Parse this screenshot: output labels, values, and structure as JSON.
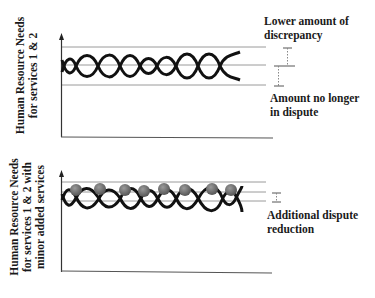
{
  "panels": [
    {
      "id": "top",
      "y_axis_label_lines": [
        "Human Resource Needs",
        "for services 1 & 2"
      ],
      "annotations": [
        {
          "lines": [
            "Lower amount of",
            "discrepancy"
          ]
        },
        {
          "lines": [
            "Amount no longer",
            "in dispute"
          ]
        }
      ],
      "has_circles": false
    },
    {
      "id": "bottom",
      "y_axis_label_lines": [
        "Human Resource Needs",
        "for services 1 & 2 with",
        "minor added services"
      ],
      "annotations": [
        {
          "lines": [
            "Additional dispute",
            "reduction"
          ]
        }
      ],
      "has_circles": true
    }
  ],
  "colors": {
    "wave": "#111111",
    "reference_line": "#9a9a9a",
    "axis": "#333333",
    "circle": "#6e6e6e"
  }
}
